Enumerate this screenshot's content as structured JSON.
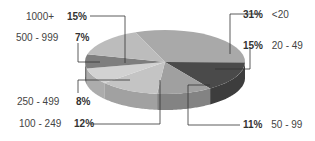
{
  "chart_data": {
    "type": "pie",
    "title": "",
    "style": "3d",
    "categories": [
      "<20",
      "20 - 49",
      "50 - 99",
      "100 - 249",
      "250 - 499",
      "500 - 999",
      "1000+"
    ],
    "values": [
      31,
      15,
      11,
      12,
      8,
      7,
      15
    ],
    "labels": [
      "31%",
      "15%",
      "11%",
      "12%",
      "8%",
      "7%",
      "15%"
    ],
    "colors": [
      "#a9a9a9",
      "#4a4a4a",
      "#a0a0a0",
      "#c4c4c4",
      "#d2d2d2",
      "#7e7e7e",
      "#bcbcbc"
    ],
    "legend": "callout labels"
  },
  "labels": {
    "l0": {
      "pct": "31%",
      "cat": "<20"
    },
    "l1": {
      "pct": "15%",
      "cat": "20 - 49"
    },
    "l2": {
      "pct": "11%",
      "cat": "50 - 99"
    },
    "l3": {
      "pct": "12%",
      "cat": "100 - 249"
    },
    "l4": {
      "pct": "8%",
      "cat": "250 - 499"
    },
    "l5": {
      "pct": "7%",
      "cat": "500 - 999"
    },
    "l6": {
      "pct": "15%",
      "cat": "1000+"
    }
  }
}
